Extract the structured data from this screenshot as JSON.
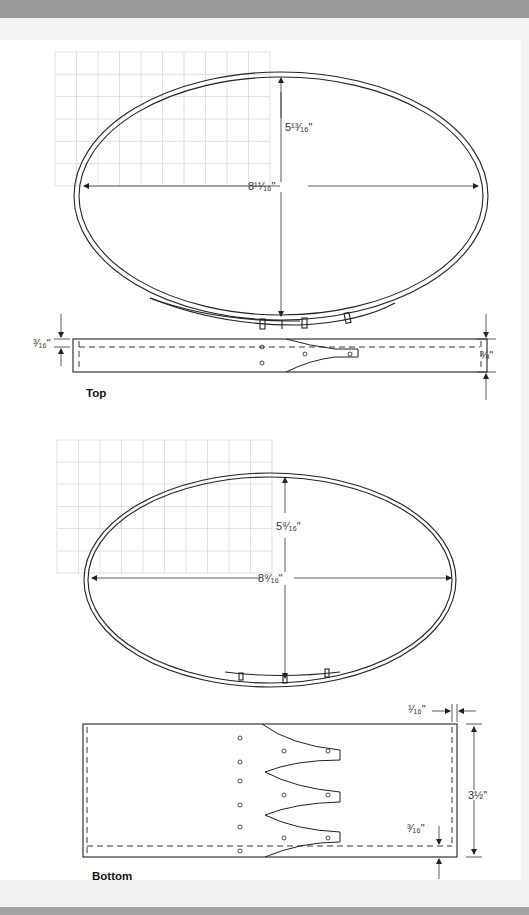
{
  "figure": {
    "top": {
      "caption": "Top",
      "ellipse": {
        "length_label": "8¹¹⁄₁₆\"",
        "width_label": "5¹³⁄₁₆\""
      },
      "band": {
        "edge_offset_label": "³⁄₁₆\"",
        "height_label": "¾\""
      },
      "grid": {
        "columns": 10,
        "rows": 6
      }
    },
    "bottom": {
      "caption": "Bottom",
      "ellipse": {
        "length_label": "8⁹⁄₁₆\"",
        "width_label": "5⁹⁄₁₆\""
      },
      "band": {
        "end_offset_label": "¹⁄₁₆\"",
        "height_label": "3½\"",
        "edge_offset_label": "³⁄₁₆\""
      },
      "grid": {
        "columns": 10,
        "rows": 6
      }
    }
  },
  "colors": {
    "line": "#222222",
    "grid": "#d6d6d6",
    "header_band": "#9a9a9a",
    "margin": "#f3f3f3"
  }
}
